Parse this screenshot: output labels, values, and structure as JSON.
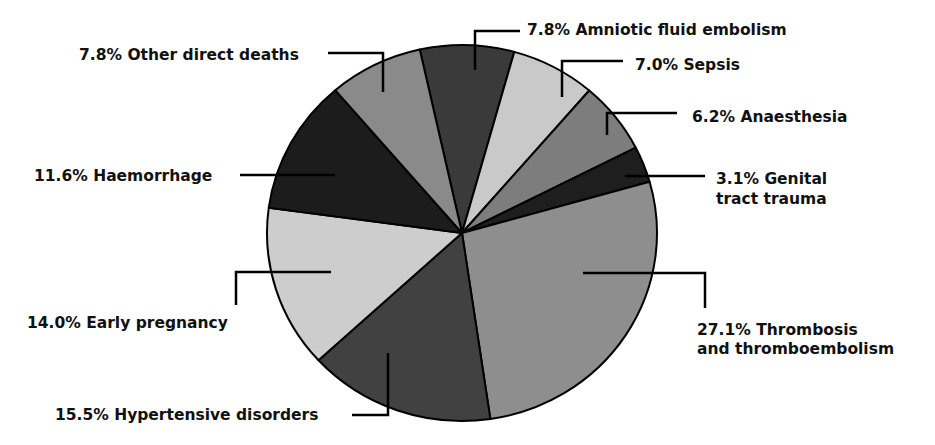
{
  "chart_data": {
    "type": "pie",
    "title": "",
    "unit": "%",
    "slices": [
      {
        "label": "Amniotic fluid embolism",
        "value": 7.8,
        "text": "7.8% Amniotic fluid embolism",
        "color": "#3a3a3a"
      },
      {
        "label": "Sepsis",
        "value": 7.0,
        "text": "7.0% Sepsis",
        "color": "#c9c9c9"
      },
      {
        "label": "Anaesthesia",
        "value": 6.2,
        "text": "6.2% Anaesthesia",
        "color": "#7d7d7d"
      },
      {
        "label": "Genital tract trauma",
        "value": 3.1,
        "text": "3.1% Genital",
        "text2": "tract trauma",
        "color": "#1e1e1e"
      },
      {
        "label": "Thrombosis and thromboembolism",
        "value": 27.1,
        "text": "27.1% Thrombosis",
        "text2": "and thromboembolism",
        "color": "#8e8e8e"
      },
      {
        "label": "Hypertensive disorders",
        "value": 15.5,
        "text": "15.5% Hypertensive disorders",
        "color": "#414141"
      },
      {
        "label": "Early pregnancy",
        "value": 14.0,
        "text": "14.0% Early pregnancy",
        "color": "#cdcdcd"
      },
      {
        "label": "Haemorrhage",
        "value": 11.6,
        "text": "11.6% Haemorrhage",
        "color": "#1c1c1c"
      },
      {
        "label": "Other direct deaths",
        "value": 7.8,
        "text": "7.8% Other direct deaths",
        "color": "#8a8a8a"
      }
    ],
    "legend": "none",
    "direction": "clockwise"
  }
}
